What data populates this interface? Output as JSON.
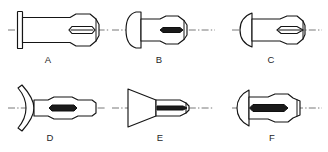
{
  "figure": {
    "background_color": "#ffffff",
    "line_color": "#151515",
    "centerline_color": "#555555",
    "slot_fill_color": "#1a1a1a",
    "rows": 2,
    "columns": 3,
    "total_parts": 6
  },
  "parts": [
    {
      "id": "part-a",
      "label": "A",
      "head_style": "flat-flange-head",
      "body_style": "tapered-grooved-pin-with-slot",
      "row": 1,
      "column": 1,
      "label_x": 48,
      "label_y": 63
    },
    {
      "id": "part-b",
      "label": "B",
      "head_style": "round-dome-head",
      "body_style": "short-grooved-pin-with-slot",
      "row": 1,
      "column": 2,
      "label_x": 159,
      "label_y": 63
    },
    {
      "id": "part-c",
      "label": "C",
      "head_style": "half-round-head",
      "body_style": "straight-grooved-pin-with-pointed-slot",
      "row": 1,
      "column": 3,
      "label_x": 271,
      "label_y": 63
    },
    {
      "id": "part-d",
      "label": "D",
      "head_style": "flared-concave-countersunk-head",
      "body_style": "barrel-grooved-pin-with-slot",
      "row": 2,
      "column": 1,
      "label_x": 50,
      "label_y": 141
    },
    {
      "id": "part-e",
      "label": "E",
      "head_style": "conical-countersunk-head",
      "body_style": "straight-grooved-pin-with-slot",
      "row": 2,
      "column": 2,
      "label_x": 160,
      "label_y": 141
    },
    {
      "id": "part-f",
      "label": "F",
      "head_style": "half-round-head",
      "body_style": "barrel-grooved-pin-with-slot",
      "row": 2,
      "column": 3,
      "label_x": 272,
      "label_y": 141
    }
  ]
}
